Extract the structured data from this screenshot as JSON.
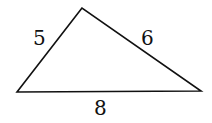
{
  "diagram": {
    "type": "triangle",
    "vertices": {
      "top": [
        82,
        8
      ],
      "bottom_left": [
        17,
        92
      ],
      "bottom_right": [
        201,
        91
      ]
    },
    "sides": [
      {
        "id": "left",
        "label": "5",
        "pos": [
          40,
          40
        ]
      },
      {
        "id": "right",
        "label": "6",
        "pos": [
          148,
          40
        ]
      },
      {
        "id": "bottom",
        "label": "8",
        "pos": [
          100,
          114
        ]
      }
    ],
    "stroke_color": "#111111"
  }
}
